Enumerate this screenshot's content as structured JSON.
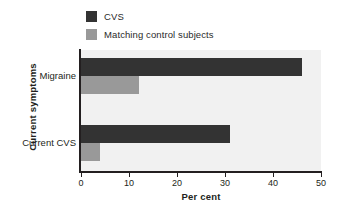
{
  "chart_data": {
    "type": "bar",
    "orientation": "horizontal",
    "title": "",
    "xlabel": "Per cent",
    "ylabel": "Current symptoms",
    "categories": [
      "Migraine",
      "Current CVS"
    ],
    "series": [
      {
        "name": "CVS",
        "values": [
          46,
          31
        ],
        "color": "#333333"
      },
      {
        "name": "Matching control subjects",
        "values": [
          12,
          4
        ],
        "color": "#999999"
      }
    ],
    "xlim": [
      0,
      50
    ],
    "xticks": [
      0,
      10,
      20,
      30,
      40,
      50
    ],
    "xtick_labels": [
      "0",
      "10",
      "20",
      "30",
      "40",
      "50"
    ],
    "grid": false,
    "legend_position": "top-left",
    "plot_background": "#f1f1f1",
    "axis_color": "#231f20"
  },
  "legend": {
    "items": [
      {
        "label": "CVS",
        "color": "#333333"
      },
      {
        "label": "Matching control subjects",
        "color": "#999999"
      }
    ]
  },
  "axes": {
    "x_title": "Per cent",
    "y_title": "Current symptoms",
    "x_ticks": [
      "0",
      "10",
      "20",
      "30",
      "40",
      "50"
    ],
    "y_categories": [
      "Migraine",
      "Current CVS"
    ]
  }
}
